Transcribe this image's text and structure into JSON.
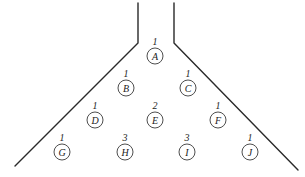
{
  "diagram": {
    "type": "funnel-bean-machine",
    "walls": {
      "left": [
        [
          138,
          3
        ],
        [
          138,
          43
        ],
        [
          15,
          166
        ]
      ],
      "right": [
        [
          174,
          3
        ],
        [
          174,
          43
        ],
        [
          298,
          170
        ]
      ]
    },
    "nodes": [
      {
        "id": "A",
        "label": "A",
        "count": "1",
        "x": 155,
        "y": 56
      },
      {
        "id": "B",
        "label": "B",
        "count": "1",
        "x": 126,
        "y": 88
      },
      {
        "id": "C",
        "label": "C",
        "count": "1",
        "x": 188,
        "y": 88
      },
      {
        "id": "D",
        "label": "D",
        "count": "1",
        "x": 95,
        "y": 120
      },
      {
        "id": "E",
        "label": "E",
        "count": "2",
        "x": 155,
        "y": 120
      },
      {
        "id": "F",
        "label": "F",
        "count": "1",
        "x": 218,
        "y": 120
      },
      {
        "id": "G",
        "label": "G",
        "count": "1",
        "x": 62,
        "y": 152
      },
      {
        "id": "H",
        "label": "H",
        "count": "3",
        "x": 125,
        "y": 152
      },
      {
        "id": "I",
        "label": "I",
        "count": "3",
        "x": 187,
        "y": 152
      },
      {
        "id": "J",
        "label": "J",
        "count": "1",
        "x": 250,
        "y": 152
      }
    ],
    "node_radius": 8,
    "count_offset_y": -15
  }
}
